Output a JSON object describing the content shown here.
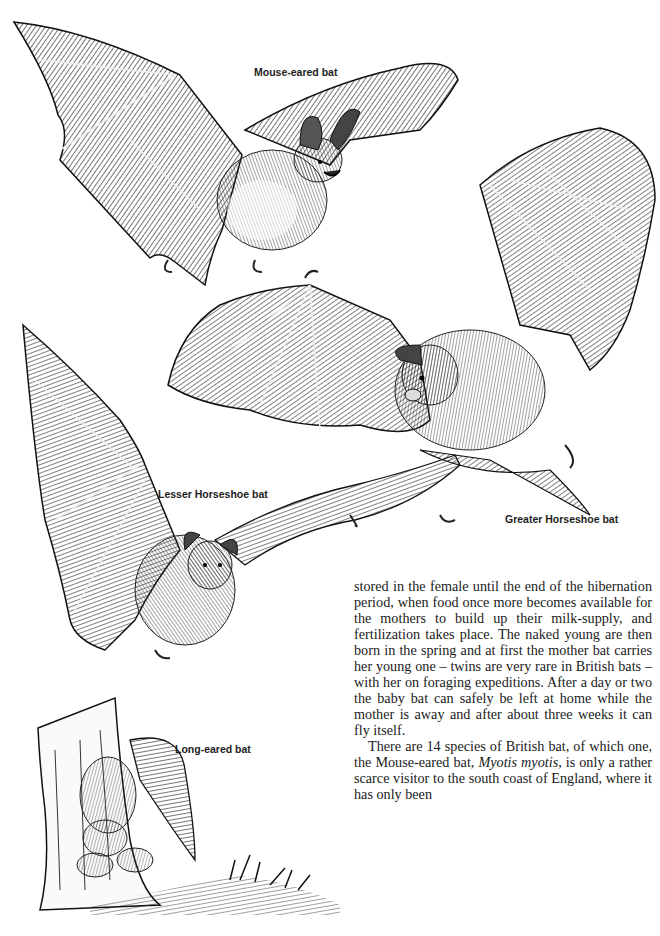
{
  "page": {
    "background": "#ffffff",
    "ink_color": "#1a1a1a"
  },
  "illustrations": [
    {
      "id": "mouse-eared-bat",
      "label": "Mouse-eared bat"
    },
    {
      "id": "greater-horseshoe-bat",
      "label": "Greater Horseshoe bat"
    },
    {
      "id": "lesser-horseshoe-bat",
      "label": "Lesser Horseshoe bat"
    },
    {
      "id": "long-eared-bat",
      "label": "Long-eared bat"
    }
  ],
  "body": {
    "paragraph_1": "stored in the female until the end of the hibernation period, when food once more becomes available for the mothers to build up their milk-supply, and fertilization takes place. The naked young are then born in the spring and at first the mother bat carries her young one – twins are very rare in British bats – with her on foraging expeditions. After a day or two the baby bat can safely be left at home while the mother is away and after about three weeks it can fly itself.",
    "paragraph_2_before_italic": "There are 14 species of British bat, of which one, the Mouse-eared bat, ",
    "paragraph_2_italic": "Myotis myotis",
    "paragraph_2_after_italic": ", is only a rather scarce visitor to the south coast of England, where it has only been"
  }
}
